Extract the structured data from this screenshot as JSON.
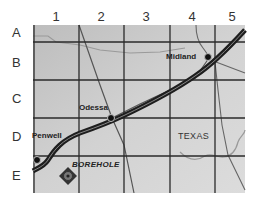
{
  "map": {
    "state_label": "TEXAS",
    "columns": [
      "1",
      "2",
      "3",
      "4",
      "5"
    ],
    "rows": [
      "A",
      "B",
      "C",
      "D",
      "E"
    ],
    "cities": [
      {
        "name": "Midland",
        "grid": "B4"
      },
      {
        "name": "Odessa",
        "grid": "C2/D2"
      },
      {
        "name": "Penwell",
        "grid": "D1/E1"
      }
    ],
    "marker": {
      "label": "BOREHOLE",
      "grid": "E1"
    },
    "colors": {
      "background": "#c8c8c8",
      "grid_line": "#2a2a2a",
      "highway": "#1e1e1e",
      "road": "#6a6a6a",
      "boundary": "#9a9a9a"
    }
  }
}
